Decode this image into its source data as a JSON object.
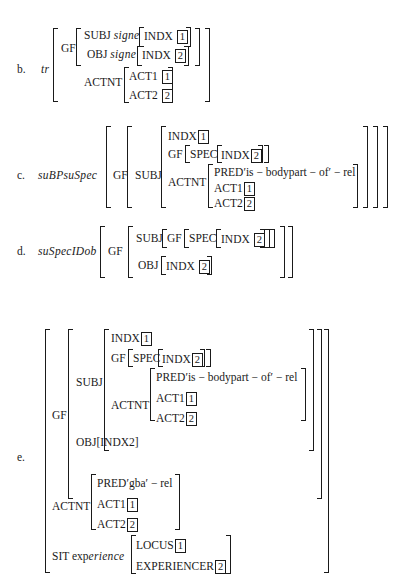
{
  "examples": {
    "b": {
      "label": "b.",
      "name": "tr",
      "gf": "GF",
      "subj": "SUBJ",
      "subj_type": "signe",
      "indx": "INDX",
      "subj_idx": "1",
      "obj": "OBJ",
      "obj_type": "signe",
      "obj_idx": "2",
      "actnt": "ACTNT",
      "act1": "ACT1",
      "act1_idx": "1",
      "act2": "ACT2",
      "act2_idx": "2"
    },
    "c": {
      "label": "c.",
      "name": "suBPsuSpec",
      "gf": "GF",
      "subj": "SUBJ",
      "indx": "INDX",
      "indx_idx": "1",
      "gf2": "GF",
      "spec": "SPEC",
      "spec_indx": "INDX",
      "spec_idx": "2",
      "actnt": "ACTNT",
      "pred": "PRED′is − bodypart − of′ − rel",
      "act1": "ACT1",
      "act1_idx": "1",
      "act2": "ACT2",
      "act2_idx": "2"
    },
    "d": {
      "label": "d.",
      "name": "suSpecIDob",
      "gf": "GF",
      "subj": "SUBJ",
      "gf2": "GF",
      "spec": "SPEC",
      "indx": "INDX",
      "subj_idx": "2",
      "obj": "OBJ",
      "obj_indx": "INDX",
      "obj_idx": "2"
    },
    "e": {
      "label": "e.",
      "gf": "GF",
      "subj": "SUBJ",
      "indx": "INDX",
      "indx_idx": "1",
      "gf2": "GF",
      "spec": "SPEC",
      "spec_indx": "INDX",
      "spec_idx": "2",
      "actnt_inner": "ACTNT",
      "pred_inner": "PRED′is − bodypart − of′ − rel",
      "act1_inner": "ACT1",
      "act1_inner_idx": "1",
      "act2_inner": "ACT2",
      "act2_inner_idx": "2",
      "obj": "OBJ[INDX2]",
      "actnt": "ACTNT",
      "pred": "PRED′gba′ − rel",
      "act1": "ACT1",
      "act1_idx": "1",
      "act2": "ACT2",
      "act2_idx": "2",
      "sit": "SIT",
      "sit_type_a": "exp",
      "sit_type_b": "erience",
      "locus": "LOCUS",
      "locus_idx": "1",
      "experiencer": "EXPERIENCER",
      "experiencer_idx": "2"
    }
  }
}
